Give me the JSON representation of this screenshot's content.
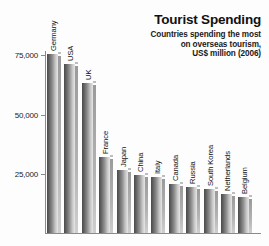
{
  "header": {
    "title": "Tourist Spending",
    "subtitle_lines": [
      "Countries spending the most",
      "on overseas tourism,",
      "US$ million (2006)"
    ]
  },
  "axis": {
    "y_ticks": [
      "75,000",
      "50,000",
      "25,000"
    ]
  },
  "chart_data": {
    "type": "bar",
    "title": "Tourist Spending",
    "subtitle": "Countries spending the most on overseas tourism, US$ million (2006)",
    "xlabel": "",
    "ylabel": "US$ million",
    "ylim": [
      0,
      80000
    ],
    "yticks": [
      25000,
      50000,
      75000
    ],
    "ytick_labels": [
      "25,000",
      "50,000",
      "75,000"
    ],
    "grid": false,
    "legend": "none",
    "categories": [
      "Germany",
      "USA",
      "UK",
      "France",
      "Japan",
      "China",
      "Italy",
      "Canada",
      "Russia",
      "South Korea",
      "Netherlands",
      "Belgium"
    ],
    "values": [
      75000,
      71000,
      63000,
      32000,
      26500,
      24500,
      23500,
      20500,
      19500,
      18500,
      16500,
      15000
    ]
  }
}
